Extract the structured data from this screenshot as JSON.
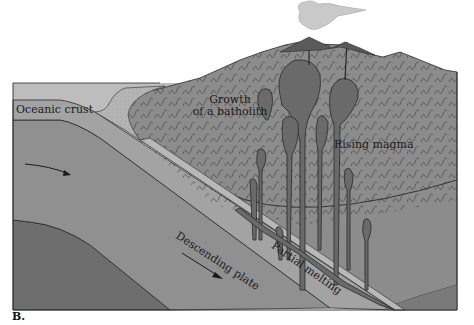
{
  "figure": {
    "panel_label": "B."
  },
  "labels": {
    "oceanic_crust": "Oceanic crust",
    "growth_line1": "Growth",
    "growth_line2": "of a batholith",
    "rising_magma": "Rising magma",
    "descending_plate": "Descending plate",
    "partial_melting": "Partial melting"
  },
  "colors": {
    "ocean_water": "#bdbdbd",
    "oceanic_crust": "#9a9a9a",
    "mantle_upper": "#8f8f8f",
    "mantle_deep": "#6e6e6e",
    "continental_crust": "#8c8c8c",
    "sediment_wedge": "#b4b4b4",
    "magma": "#6a6a6a",
    "slab_surface": "#b8b8b8",
    "outline": "#2a2a2a",
    "ash_cloud": "#c9c9c9"
  }
}
